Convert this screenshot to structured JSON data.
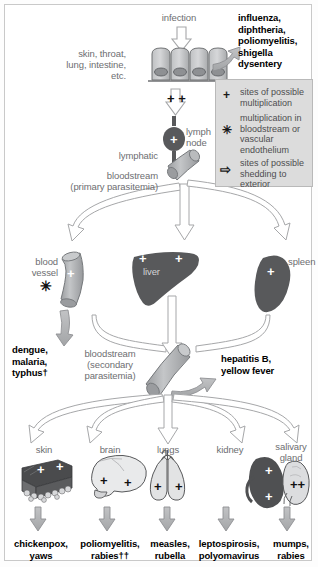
{
  "figure": {
    "entry": {
      "infection_label": "infection",
      "portal_label": "skin, throat,\nlung, intestine,\netc.",
      "epithelium_name": "epithelial-cell-layer",
      "epithelium_cells": 4,
      "local_multiplication_marks": "+ +"
    },
    "shed_top": {
      "diseases": "influenza,\ndiphtheria,\npoliomyelitis,\nshigella\ndysentery"
    },
    "legend": {
      "items": [
        {
          "symbol": "+",
          "symbol_name": "plus-symbol",
          "text": "sites of possible\nmultiplication"
        },
        {
          "symbol": "✳",
          "symbol_name": "asterisk-symbol",
          "text": "multiplication in\nbloodstream or\nvascular\nendothelium"
        },
        {
          "symbol": "⇨",
          "symbol_name": "shedding-arrow-symbol",
          "text": "sites of possible\nshedding to\nexterior"
        }
      ]
    },
    "lymphatic": {
      "lymphatic_label": "lymphatic",
      "lymph_node_label": "lymph\nnode",
      "lymph_node_mark": "+"
    },
    "bloodstream_primary": {
      "label": "bloodstream\n(primary parasitemia)"
    },
    "organs_primary": [
      {
        "name": "blood-vessel",
        "label": "blood\nvessel",
        "marks": [
          "+"
        ],
        "extra_symbol": "✳"
      },
      {
        "name": "liver",
        "label": "liver",
        "marks": [
          "+",
          "+"
        ]
      },
      {
        "name": "spleen",
        "label": "spleen",
        "marks": [
          "+"
        ]
      }
    ],
    "shed_vessel": {
      "diseases": "dengue,\nmalaria,\ntyphus†"
    },
    "bloodstream_secondary": {
      "label": "bloodstream\n(secondary\nparasitemia)"
    },
    "shed_secondary": {
      "diseases": "hepatitis B,\nyellow fever"
    },
    "organs_terminal": [
      {
        "name": "skin",
        "label": "skin",
        "marks": [
          "+",
          "+"
        ],
        "diseases": "chickenpox,\nyaws"
      },
      {
        "name": "brain",
        "label": "brain",
        "marks": [
          "+",
          "+"
        ],
        "diseases": "poliomyelitis,\nrabies††"
      },
      {
        "name": "lungs",
        "label": "lungs",
        "marks": [
          "+",
          "+"
        ],
        "diseases": "measles,\nrubella"
      },
      {
        "name": "kidney",
        "label": "kidney",
        "marks": [
          "+",
          "+"
        ],
        "diseases": "leptospirosis,\npolyomavirus"
      },
      {
        "name": "salivary-gland",
        "label": "salivary\ngland",
        "marks": [
          "++"
        ],
        "diseases": "mumps,\nrabies"
      }
    ],
    "colors": {
      "text_gray": "#6d6e71",
      "text_black": "#000000",
      "organ_dark": "#58595b",
      "organ_mid": "#a7a9ac",
      "organ_light": "#d9dadb",
      "arrow_outline": "#9a9a9a",
      "arrow_fill_gray": "#b0b1b3",
      "legend_bg": "#dcdcdc",
      "frame": "#c9c9c9"
    }
  }
}
